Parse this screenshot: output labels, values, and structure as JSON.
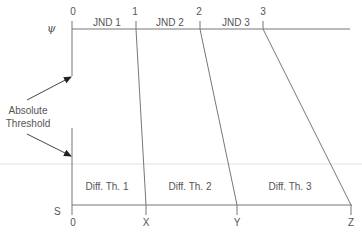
{
  "diagram": {
    "psychological_axis": {
      "symbol": "ψ",
      "tick_labels": [
        "0",
        "1",
        "2",
        "3"
      ],
      "interval_labels": [
        "JND 1",
        "JND 2",
        "JND 3"
      ]
    },
    "physical_axis": {
      "symbol": "S",
      "tick_labels": [
        "0",
        "X",
        "Y",
        "Z"
      ],
      "interval_labels": [
        "Diff. Th. 1",
        "Diff. Th. 2",
        "Diff. Th. 3"
      ]
    },
    "annotation": {
      "line1": "Absolute",
      "line2": "Threshold"
    },
    "colors": {
      "line": "#6a6a6a",
      "faint_line": "#dddddd",
      "arrow": "#222222",
      "text": "#555555"
    }
  }
}
